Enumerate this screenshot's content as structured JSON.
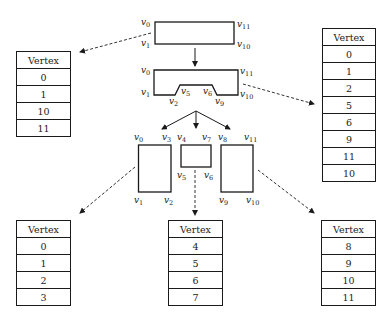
{
  "diagram": {
    "shapes": {
      "original": {
        "labels": [
          "v0",
          "v1",
          "v10",
          "v11"
        ]
      },
      "notched": {
        "labels": [
          "v0",
          "v1",
          "v2",
          "v5",
          "v6",
          "v9",
          "v10",
          "v11"
        ]
      },
      "left_piece": {
        "labels": [
          "v0",
          "v1",
          "v2",
          "v3"
        ]
      },
      "middle_piece": {
        "labels": [
          "v4",
          "v5",
          "v6",
          "v7"
        ]
      },
      "right_piece": {
        "labels": [
          "v8",
          "v9",
          "v10",
          "v11"
        ]
      }
    },
    "tables": {
      "original": {
        "header": "Vertex",
        "rows": [
          "0",
          "1",
          "10",
          "11"
        ]
      },
      "notched": {
        "header": "Vertex",
        "rows": [
          "0",
          "1",
          "2",
          "5",
          "6",
          "9",
          "11",
          "10"
        ]
      },
      "left": {
        "header": "Vertex",
        "rows": [
          "0",
          "1",
          "2",
          "3"
        ]
      },
      "middle": {
        "header": "Vertex",
        "rows": [
          "4",
          "5",
          "6",
          "7"
        ]
      },
      "right": {
        "header": "Vertex",
        "rows": [
          "8",
          "9",
          "10",
          "11"
        ]
      }
    }
  }
}
